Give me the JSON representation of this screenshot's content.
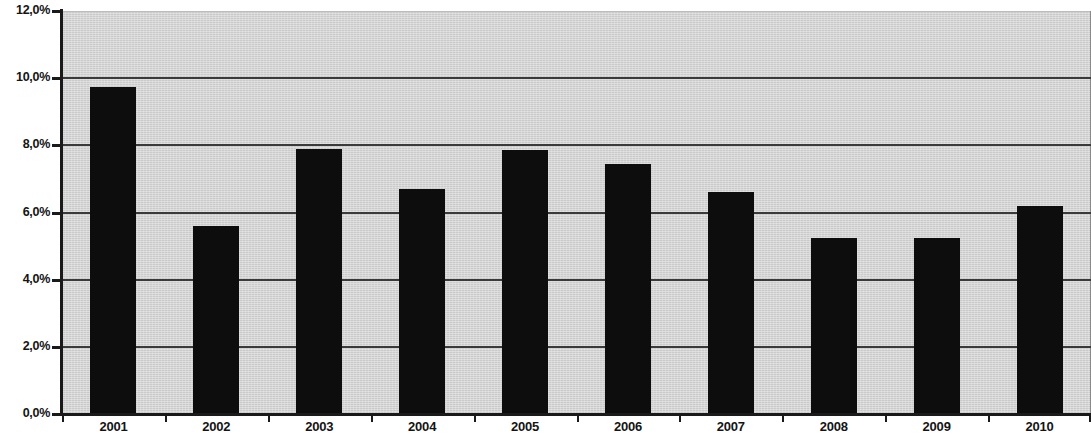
{
  "chart_data": {
    "type": "bar",
    "title": "",
    "subtitle": "",
    "xlabel": "",
    "ylabel": "",
    "categories": [
      "2001",
      "2002",
      "2003",
      "2004",
      "2005",
      "2006",
      "2007",
      "2008",
      "2009",
      "2010"
    ],
    "values": [
      9.75,
      5.6,
      7.9,
      6.7,
      7.85,
      7.45,
      6.6,
      5.25,
      5.25,
      6.2
    ],
    "value_labels": [
      "",
      "",
      "",
      "",
      "",
      "",
      "",
      "",
      "",
      ""
    ],
    "ylim": [
      0,
      12
    ],
    "ytick_values": [
      0,
      2,
      4,
      6,
      8,
      10,
      12
    ],
    "ytick_labels": [
      "0,0%",
      "2,0%",
      "4,0%",
      "6,0%",
      "8,0%",
      "10,0%",
      "12,0%"
    ],
    "grid": true,
    "grid_axis": "y",
    "legend": null,
    "legend_position": "none",
    "series": [
      {
        "name": "",
        "values": [
          9.75,
          5.6,
          7.9,
          6.7,
          7.85,
          7.45,
          6.6,
          5.25,
          5.25,
          6.2
        ],
        "color": "#0d0d0d"
      }
    ],
    "colors": {
      "bar": "#0d0d0d",
      "plot_background": "#d4d4d4",
      "gridline": "#3a3a3a",
      "axis": "#1a1a1a",
      "page_background": "#ffffff",
      "tick_label": "#141414"
    }
  }
}
